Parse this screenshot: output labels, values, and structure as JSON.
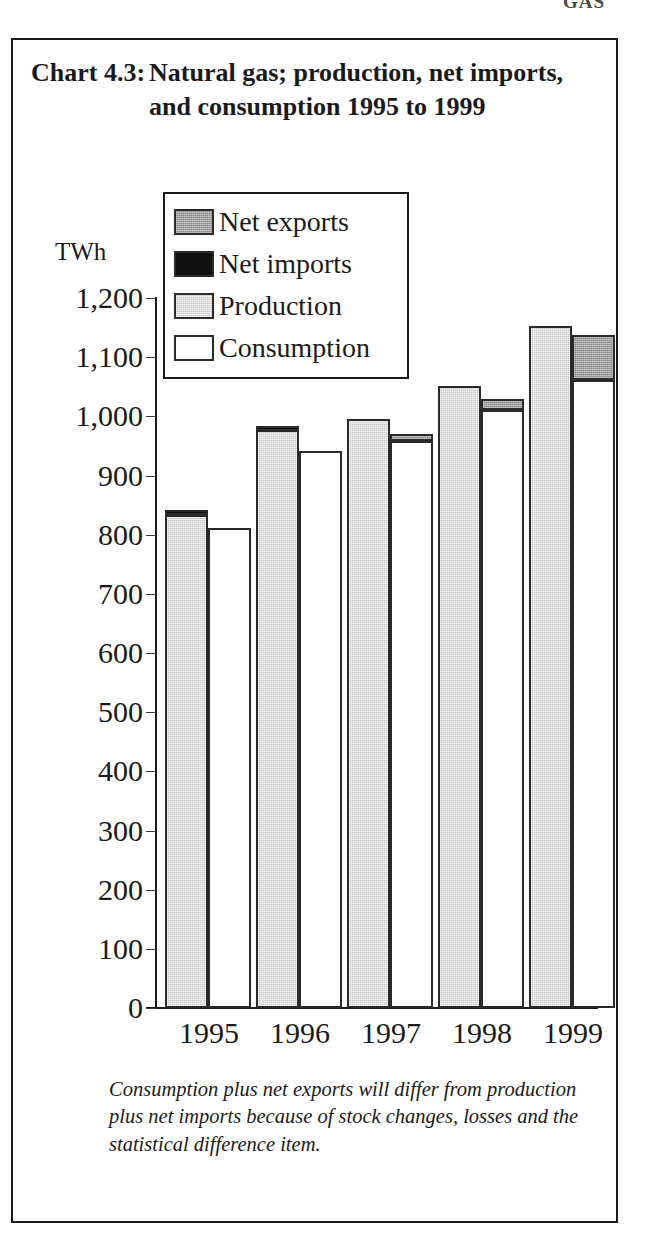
{
  "page": {
    "running_head": "GAS"
  },
  "chart": {
    "number_label": "Chart 4.3:",
    "title": "Natural gas; production, net imports, and consumption 1995 to 1999",
    "footnote": "Consumption plus net exports will differ from production plus net imports because of stock changes, losses and the statistical difference item."
  },
  "colors": {
    "net_exports": "#8c8c8c",
    "net_imports": "#101010",
    "production": "#c9c9c9",
    "consumption": "#ffffff",
    "axis": "#1a1a1a",
    "frame": "#1a1a1a"
  },
  "chart_data": {
    "type": "bar",
    "xlabel": "",
    "ylabel": "TWh",
    "ylim": [
      0,
      1200
    ],
    "ytick_step": 100,
    "ytick_labels": [
      "1,200",
      "1,100",
      "1,000",
      "900",
      "800",
      "700",
      "600",
      "500",
      "400",
      "300",
      "200",
      "100",
      "0"
    ],
    "ytick_values": [
      1200,
      1100,
      1000,
      900,
      800,
      700,
      600,
      500,
      400,
      300,
      200,
      100,
      0
    ],
    "grid": false,
    "legend_position": "upper-left-inside",
    "legend": [
      "Net exports",
      "Net imports",
      "Production",
      "Consumption"
    ],
    "categories": [
      "1995",
      "1996",
      "1997",
      "1998",
      "1999"
    ],
    "series": [
      {
        "name": "Production",
        "values": [
          834,
          977,
          995,
          1051,
          1153
        ]
      },
      {
        "name": "Net imports",
        "values": [
          841,
          983,
          0,
          0,
          0
        ]
      },
      {
        "name": "Consumption",
        "values": [
          812,
          941,
          958,
          1010,
          1061
        ]
      },
      {
        "name": "Net exports",
        "values": [
          0,
          0,
          970,
          1029,
          1137
        ]
      }
    ],
    "note": "Production column carries a black net-imports cap in 1995 and 1996; consumption column carries a grey net-exports cap in 1997, 1998 and 1999."
  }
}
